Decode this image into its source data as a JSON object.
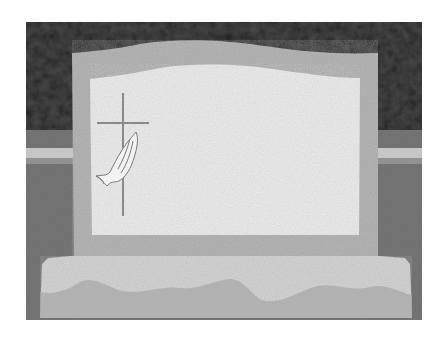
{
  "image": {
    "subject": "Blank upright granite headstone with engraved cross and praying hands",
    "alt": "Gray granite headstone with a wavy serpentine top, polished light inner panel, engraved cross with praying hands on the left, set on a rough-cut rock-pitch base in a cemetery lawn"
  },
  "colors": {
    "background_white": "#ffffff",
    "trees_dark": "#3c3c3c",
    "grass_mid": "#6e6e6e",
    "road_light": "#cfcfcf",
    "stone_frame": "#b4b4b4",
    "inner_panel": "#ececec",
    "base_stone": "#d2d2d2",
    "engraving": "#8a8a8a"
  },
  "elements": {
    "emblem": "cross-with-praying-hands",
    "inscription": ""
  }
}
